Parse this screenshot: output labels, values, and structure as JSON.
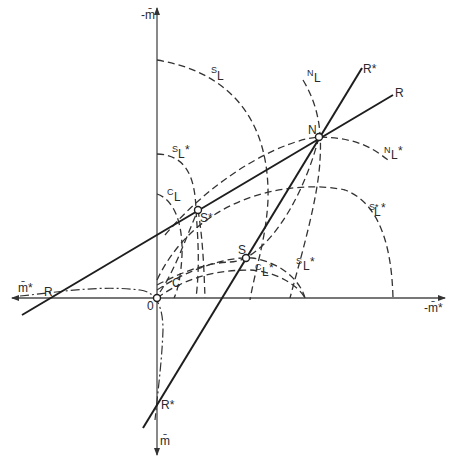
{
  "diagram": {
    "axes": {
      "up": "-m̄",
      "down": "m̄",
      "left": "m̄*",
      "right": "-m̄*",
      "origin": "0"
    },
    "points": {
      "N": "N",
      "S": "S",
      "S_star": "S*",
      "C": "C",
      "R_left": "R",
      "R_star_bottom": "R*"
    },
    "lines": {
      "R_end": "R",
      "R_star_end": "R*"
    },
    "curves": {
      "sL": {
        "pre": "S",
        "main": "L",
        "post": ""
      },
      "nL": {
        "pre": "N",
        "main": "L",
        "post": ""
      },
      "nL_star": {
        "pre": "N",
        "main": "L",
        "post": "*"
      },
      "sL_star_upper": {
        "pre": "S",
        "main": "L",
        "post": "*"
      },
      "cL": {
        "pre": "C",
        "main": "L",
        "post": ""
      },
      "cL_star": {
        "pre": "C",
        "main": "L",
        "post": "*"
      },
      "sL_star_lower": {
        "pre": "S",
        "main": "L",
        "post": "*"
      },
      "sL_star_star": {
        "pre": "S*",
        "main": "L",
        "post": "*"
      }
    }
  }
}
